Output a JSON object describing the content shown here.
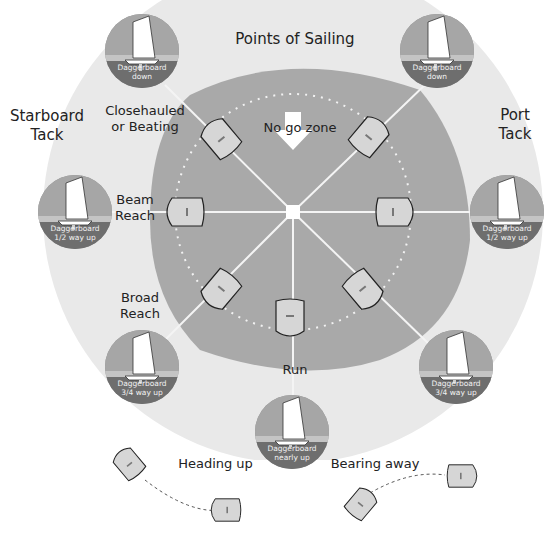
{
  "diagram": {
    "title": "Points of Sailing",
    "colors": {
      "background": "#ffffff",
      "outer_ring": "#e9e9e9",
      "water": "#a9a9a9",
      "medal_dark": "#6e6e6e",
      "medal_light": "#a6a6a6",
      "boat_fill": "#d6d6d6",
      "text": "#222222"
    },
    "tacks": {
      "starboard": [
        "Starboard",
        "Tack"
      ],
      "port": [
        "Port",
        "Tack"
      ]
    },
    "zone_label": "No go zone",
    "points": {
      "closehauled": [
        "Closehauled",
        "or Beating"
      ],
      "beam_reach": [
        "Beam",
        "Reach"
      ],
      "broad_reach": [
        "Broad",
        "Reach"
      ],
      "run": "Run"
    },
    "medallions": [
      {
        "id": "top-left",
        "caption": [
          "Daggerboard",
          "down"
        ]
      },
      {
        "id": "top-right",
        "caption": [
          "Daggerboard",
          "down"
        ]
      },
      {
        "id": "mid-left",
        "caption": [
          "Daggerboard",
          "1/2 way up"
        ]
      },
      {
        "id": "mid-right",
        "caption": [
          "Daggerboard",
          "1/2 way up"
        ]
      },
      {
        "id": "low-left",
        "caption": [
          "Daggerboard",
          "3/4 way up"
        ]
      },
      {
        "id": "low-right",
        "caption": [
          "Daggerboard",
          "3/4 way up"
        ]
      },
      {
        "id": "bottom",
        "caption": [
          "Daggerboard",
          "nearly up"
        ]
      }
    ],
    "manoeuvres": {
      "heading_up": "Heading up",
      "bearing_away": "Bearing away"
    }
  }
}
